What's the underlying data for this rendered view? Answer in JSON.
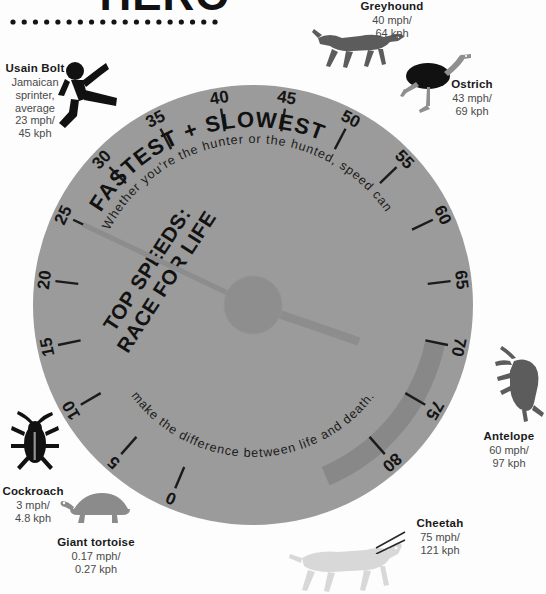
{
  "header": {
    "title": "HERO",
    "divider": "dotted-rule"
  },
  "dial": {
    "heading_line1": "TOP SPEEDS:",
    "heading_line2": "RACE FOR LIFE",
    "subheading": "FASTEST + SLOWEST",
    "body_text_top": "Whether you're the hunter or the hunted, speed can",
    "body_text_bottom": "make the difference between life and death.",
    "body_text_full": "Whether you're the hunter or the hunted, speed can make the difference between life and death.",
    "unit": "mph",
    "scale_min": 0,
    "scale_max": 85,
    "needle_value": 25,
    "needle_tail_value": 72,
    "highlight_band": {
      "from": 70,
      "to": 85
    },
    "colors": {
      "dial_face": "#9b9b9b",
      "dial_hub": "#8e8e8e",
      "needle": "#8d8d8d",
      "band": "#888888",
      "tick": "#1b1b1b",
      "label": "#141414",
      "dark_silhouette": "#5c5c5c",
      "black_silhouette": "#111111",
      "light_silhouette": "#d8d8d8",
      "page_bg": "#fdfdfd"
    },
    "ticks": [
      {
        "value": 0,
        "label": "0"
      },
      {
        "value": 5,
        "label": "5"
      },
      {
        "value": 10,
        "label": "10"
      },
      {
        "value": 15,
        "label": "15"
      },
      {
        "value": 20,
        "label": "20"
      },
      {
        "value": 25,
        "label": "25"
      },
      {
        "value": 30,
        "label": "30"
      },
      {
        "value": 35,
        "label": "35"
      },
      {
        "value": 40,
        "label": "40"
      },
      {
        "value": 45,
        "label": "45"
      },
      {
        "value": 50,
        "label": "50"
      },
      {
        "value": 55,
        "label": "55"
      },
      {
        "value": 60,
        "label": "60"
      },
      {
        "value": 65,
        "label": "65"
      },
      {
        "value": 70,
        "label": "70"
      },
      {
        "value": 75,
        "label": "75"
      },
      {
        "value": 80,
        "label": "80"
      }
    ]
  },
  "chart_data": {
    "type": "bar",
    "title": "TOP SPEEDS: RACE FOR LIFE",
    "subtitle": "FASTEST + SLOWEST",
    "xlabel": "",
    "ylabel": "Top speed (mph)",
    "ylim": [
      0,
      85
    ],
    "categories": [
      "Giant tortoise",
      "Cockroach",
      "Usain Bolt",
      "Greyhound",
      "Ostrich",
      "Antelope",
      "Cheetah"
    ],
    "values": [
      0.17,
      3,
      23,
      40,
      43,
      60,
      75
    ],
    "values_kph": [
      0.27,
      4.8,
      45,
      64,
      69,
      97,
      121
    ],
    "series": [
      {
        "name": "mph",
        "values": [
          0.17,
          3,
          23,
          40,
          43,
          60,
          75
        ]
      },
      {
        "name": "kph",
        "values": [
          0.27,
          4.8,
          45,
          64,
          69,
          97,
          121
        ]
      }
    ],
    "grid": false,
    "legend": "none",
    "annotations": [
      "Whether you're the hunter or the hunted, speed can make the difference between life and death."
    ]
  },
  "animals": {
    "bolt": {
      "name": "Usain Bolt",
      "desc": "Jamaican sprinter, average",
      "mph": "23 mph/",
      "kph": "45 kph",
      "icon": "sprinter-icon"
    },
    "grey": {
      "name": "Greyhound",
      "desc": "",
      "mph": "40 mph/",
      "kph": "64 kph",
      "icon": "greyhound-icon"
    },
    "ostrich": {
      "name": "Ostrich",
      "desc": "",
      "mph": "43 mph/",
      "kph": "69 kph",
      "icon": "ostrich-icon"
    },
    "antelope": {
      "name": "Antelope",
      "desc": "",
      "mph": "60 mph/",
      "kph": "97 kph",
      "icon": "antelope-icon"
    },
    "cheetah": {
      "name": "Cheetah",
      "desc": "",
      "mph": "75 mph/",
      "kph": "121 kph",
      "icon": "cheetah-icon"
    },
    "cockroach": {
      "name": "Cockroach",
      "desc": "",
      "mph": "3 mph/",
      "kph": "4.8 kph",
      "icon": "cockroach-icon"
    },
    "tortoise": {
      "name": "Giant tortoise",
      "desc": "",
      "mph": "0.17 mph/",
      "kph": "0.27 kph",
      "icon": "tortoise-icon"
    }
  }
}
